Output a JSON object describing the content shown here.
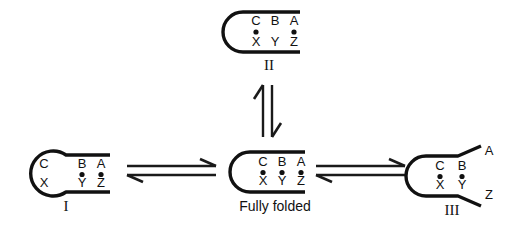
{
  "figure": {
    "type": "rna-folding-equilibrium-diagram",
    "background_color": "#ffffff",
    "stroke_color": "#111111"
  },
  "structures": {
    "I": {
      "label": "I",
      "label_style": "roman-numeral",
      "top_bases": [
        "C",
        "B",
        "A"
      ],
      "bottom_bases": [
        "X",
        "Y",
        "Z"
      ],
      "pairs": [
        {
          "top": "C",
          "bottom": "X",
          "paired": false
        },
        {
          "top": "B",
          "bottom": "Y",
          "paired": true
        },
        {
          "top": "A",
          "bottom": "Z",
          "paired": true
        }
      ],
      "description": "open loop at C-X"
    },
    "II": {
      "label": "II",
      "label_style": "roman-numeral",
      "top_bases": [
        "C",
        "B",
        "A"
      ],
      "bottom_bases": [
        "X",
        "Y",
        "Z"
      ],
      "pairs": [
        {
          "top": "C",
          "bottom": "X",
          "paired": true
        },
        {
          "top": "B",
          "bottom": "Y",
          "paired": false
        },
        {
          "top": "A",
          "bottom": "Z",
          "paired": true
        }
      ],
      "description": "internal B-Y pair broken"
    },
    "FULLY_FOLDED": {
      "label": "Fully folded",
      "label_style": "text",
      "top_bases": [
        "C",
        "B",
        "A"
      ],
      "bottom_bases": [
        "X",
        "Y",
        "Z"
      ],
      "pairs": [
        {
          "top": "C",
          "bottom": "X",
          "paired": true
        },
        {
          "top": "B",
          "bottom": "Y",
          "paired": true
        },
        {
          "top": "A",
          "bottom": "Z",
          "paired": true
        }
      ],
      "description": "all three pairs formed"
    },
    "III": {
      "label": "III",
      "label_style": "roman-numeral",
      "top_bases": [
        "C",
        "B"
      ],
      "bottom_bases": [
        "X",
        "Y"
      ],
      "splayed_top_base": "A",
      "splayed_bottom_base": "Z",
      "pairs": [
        {
          "top": "C",
          "bottom": "X",
          "paired": true
        },
        {
          "top": "B",
          "bottom": "Y",
          "paired": true
        },
        {
          "top": "A",
          "bottom": "Z",
          "paired": false
        }
      ],
      "description": "terminal A-Z pair frayed open"
    }
  },
  "arrows": {
    "left_equilibrium": {
      "name": "equilibrium-arrow-I-to-fully-folded",
      "orientation": "horizontal",
      "type": "double-half-arrow"
    },
    "right_equilibrium": {
      "name": "equilibrium-arrow-fully-folded-to-III",
      "orientation": "horizontal",
      "type": "double-half-arrow"
    },
    "vertical_equilibrium": {
      "name": "equilibrium-arrow-fully-folded-to-II",
      "orientation": "vertical",
      "type": "double-half-arrow"
    }
  }
}
